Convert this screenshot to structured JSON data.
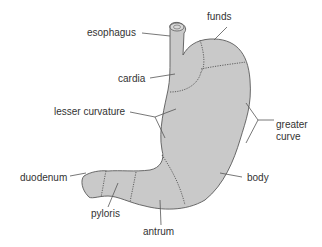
{
  "diagram": {
    "colors": {
      "organ_fill": "#c9c9c9",
      "outline": "#5a5a5a",
      "text": "#333333",
      "background": "#ffffff"
    },
    "labels": {
      "esophagus": "esophagus",
      "funds": "funds",
      "cardia": "cardia",
      "lesser_curvature": "lesser curvature",
      "greater_line1": "greater",
      "greater_line2": "curve",
      "duodenum": "duodenum",
      "body": "body",
      "pyloris": "pyloris",
      "antrum": "antrum"
    }
  }
}
